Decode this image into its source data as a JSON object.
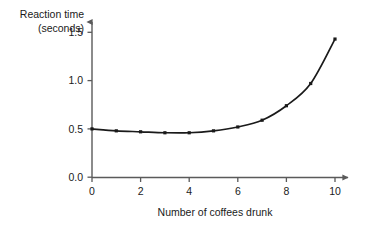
{
  "chart_data": {
    "type": "line",
    "title": "",
    "xlabel": "Number of coffees drunk",
    "ylabel": "Reaction time (seconds)",
    "ylabel_line1": "Reaction time",
    "ylabel_line2": "(seconds)",
    "x": [
      0,
      1,
      2,
      3,
      4,
      5,
      6,
      7,
      8,
      9,
      10
    ],
    "values": [
      0.5,
      0.48,
      0.47,
      0.46,
      0.46,
      0.48,
      0.52,
      0.59,
      0.74,
      0.97,
      1.43
    ],
    "xlim": [
      0,
      10
    ],
    "ylim": [
      0.0,
      1.5
    ],
    "xticks": [
      0,
      2,
      4,
      6,
      8,
      10
    ],
    "xtick_labels": [
      "0",
      "2",
      "4",
      "6",
      "8",
      "10"
    ],
    "yticks": [
      0.0,
      0.5,
      1.0,
      1.5
    ],
    "ytick_labels": [
      "0.0",
      "0.5",
      "1.0",
      "1.5"
    ],
    "grid": false,
    "legend": null,
    "marker": "square-dot",
    "line_color": "#1a1a1a",
    "marker_color": "#1a1a1a",
    "axis_color": "#5a5a5a",
    "background": "#ffffff",
    "axis_arrows": true
  }
}
